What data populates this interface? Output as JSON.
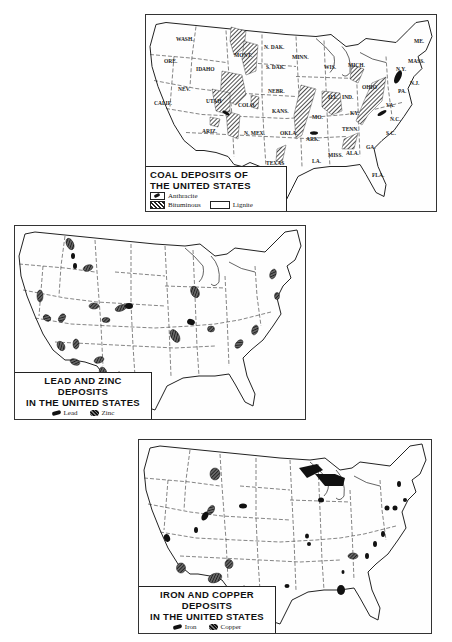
{
  "maps": {
    "coal": {
      "title_line1": "COAL DEPOSITS OF",
      "title_line2": "THE UNITED STATES",
      "legend": {
        "anthracite": "Anthracite",
        "bituminous": "Bituminous",
        "lignite": "Lignite"
      },
      "state_labels": [
        "WASH.",
        "ORE.",
        "IDAHO",
        "MONT.",
        "N. DAK.",
        "S. DAK.",
        "MINN.",
        "WIS.",
        "MICH.",
        "NEV.",
        "CALIF.",
        "UTAH",
        "COLO.",
        "NEBR.",
        "KANS.",
        "MO.",
        "ILL.",
        "IND.",
        "OHIO",
        "N.Y.",
        "PA.",
        "N.J.",
        "KY.",
        "TENN.",
        "ARIZ.",
        "N. MEX.",
        "OKLA.",
        "ARK.",
        "TEXAS",
        "LA.",
        "MISS.",
        "ALA.",
        "GA.",
        "FLA.",
        "VA.",
        "N.C.",
        "S.C.",
        "ME.",
        "MASS."
      ]
    },
    "lead_zinc": {
      "title_line1": "LEAD AND ZINC DEPOSITS",
      "title_line2": "IN THE UNITED STATES",
      "legend": {
        "lead": "Lead",
        "zinc": "Zinc"
      }
    },
    "iron_copper": {
      "title_line1": "IRON AND COPPER DEPOSITS",
      "title_line2": "IN THE UNITED STATES",
      "legend": {
        "iron": "Iron",
        "copper": "Copper"
      }
    }
  },
  "colors": {
    "ink": "#111111",
    "paper": "#ffffff",
    "border": "#333333"
  }
}
